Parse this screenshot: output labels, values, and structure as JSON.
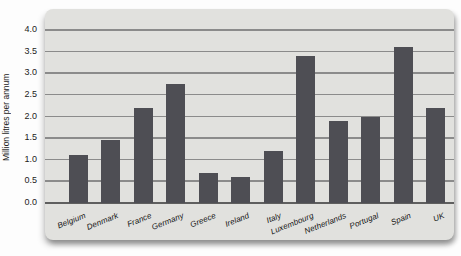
{
  "chart_data": {
    "type": "bar",
    "title": "",
    "xlabel": "",
    "ylabel": "Million litres per annum",
    "categories": [
      "Belgium",
      "Denmark",
      "France",
      "Germany",
      "Greece",
      "Ireland",
      "Italy",
      "Luxembourg",
      "Netherlands",
      "Portugal",
      "Spain",
      "UK"
    ],
    "values": [
      1.1,
      1.45,
      2.2,
      2.75,
      0.7,
      0.6,
      1.2,
      3.4,
      1.9,
      2.0,
      3.6,
      2.2
    ],
    "ylim": [
      0.0,
      4.0
    ],
    "ytick_step": 0.5,
    "ytick_labels": [
      "0.0",
      "0.5",
      "1.0",
      "1.5",
      "2.0",
      "2.5",
      "3.0",
      "3.5",
      "4.0"
    ],
    "grid": true,
    "legend": "none",
    "colors": {
      "bar": "#4e4e54",
      "panel_bg": "#e1e1de",
      "gridline": "#8b8b8b",
      "axis_line": "#5f5f5f",
      "tick_text": "#1c1c1c",
      "page_bg": "#fdfdfd"
    }
  }
}
